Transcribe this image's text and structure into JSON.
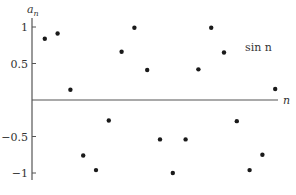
{
  "chart_data": {
    "type": "scatter",
    "title": "",
    "series_label": "sin n",
    "xlabel": "n",
    "ylabel": "a",
    "ylabel_subscript": "n",
    "x": [
      1,
      2,
      3,
      4,
      5,
      6,
      7,
      8,
      9,
      10,
      11,
      12,
      13,
      14,
      15,
      16,
      17,
      18,
      19
    ],
    "values": [
      0.84,
      0.91,
      0.14,
      -0.76,
      -0.96,
      -0.28,
      0.66,
      0.99,
      0.41,
      -0.54,
      -1.0,
      -0.54,
      0.42,
      0.99,
      0.65,
      -0.29,
      -0.96,
      -0.75,
      0.15
    ],
    "ylim": [
      -1.1,
      1.1
    ],
    "yticks": [
      1,
      0.5,
      -0.5,
      -1
    ],
    "ytick_labels": [
      "1",
      "0.5",
      "−0.5",
      "−1"
    ],
    "grid": false,
    "legend": "none",
    "colors": {
      "axis": "#555555",
      "points": "#1a1a1a",
      "text": "#333333"
    }
  }
}
